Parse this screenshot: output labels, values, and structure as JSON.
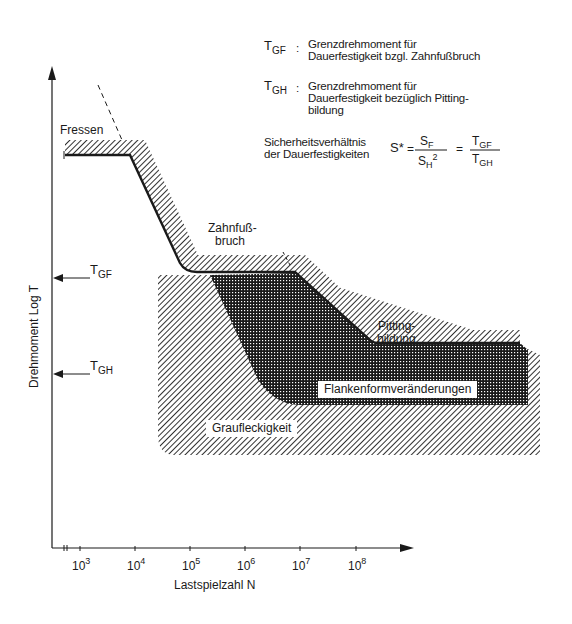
{
  "legend": {
    "tgf": {
      "symbol": "T",
      "subscript": "GF",
      "separator": ":",
      "line1": "Grenzdrehmoment für",
      "line2": "Dauerfestigkeit bzgl. Zahnfußbruch"
    },
    "tgh": {
      "symbol": "T",
      "subscript": "GH",
      "separator": ":",
      "line1": "Grenzdrehmoment für",
      "line2": "Dauerfestigkeit bezüglich Pitting-",
      "line3": "bildung"
    },
    "ratio": {
      "line1": "Sicherheitsverhältnis",
      "line2": "der Dauerfestigkeiten",
      "lhs": "S*",
      "eq1": "=",
      "num1": "S",
      "num1_sub": "F",
      "den1": "S",
      "den1_sub": "H",
      "den1_sup": "2",
      "eq2": "=",
      "num2": "T",
      "num2_sub": "GF",
      "den2": "T",
      "den2_sub": "GH"
    }
  },
  "axes": {
    "y_title": "Drehmoment  Log T",
    "x_title": "Lastspielzahl  N",
    "x_ticks": [
      {
        "base": "10",
        "exp": "3"
      },
      {
        "base": "10",
        "exp": "4"
      },
      {
        "base": "10",
        "exp": "5"
      },
      {
        "base": "10",
        "exp": "6"
      },
      {
        "base": "10",
        "exp": "7"
      },
      {
        "base": "10",
        "exp": "8"
      }
    ],
    "y_markers": [
      {
        "symbol": "T",
        "subscript": "GF"
      },
      {
        "symbol": "T",
        "subscript": "GH"
      }
    ]
  },
  "regions": {
    "fressen": "Fressen",
    "zahnfuss_line1": "Zahnfuß-",
    "zahnfuss_line2": "bruch",
    "pitting_line1": "Pitting-",
    "pitting_line2": "bildung",
    "flanken": "Flankenformveränderungen",
    "graufleckigkeit": "Graufleckigkeit"
  },
  "colors": {
    "ink": "#1a1a1a",
    "background": "#ffffff"
  }
}
